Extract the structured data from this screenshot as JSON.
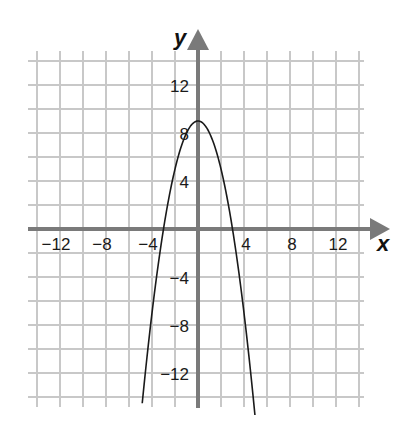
{
  "chart_data": {
    "type": "line",
    "title": "",
    "xlabel": "x",
    "ylabel": "y",
    "xlim": [
      -14,
      14
    ],
    "ylim": [
      -14,
      14
    ],
    "grid": true,
    "grid_step": 2,
    "x_ticks": [
      -12,
      -8,
      -4,
      4,
      8,
      12
    ],
    "y_ticks": [
      12,
      8,
      4,
      -4,
      -8,
      -12
    ],
    "x_tick_labels": [
      "−12",
      "−8",
      "−4",
      "4",
      "8",
      "12"
    ],
    "y_tick_labels": [
      "12",
      "8",
      "4",
      "−4",
      "−8",
      "−12"
    ],
    "series": [
      {
        "name": "parabola",
        "equation": "y = 9 - x^2",
        "vertex": [
          0,
          9
        ],
        "x_intercepts": [
          -3,
          3
        ],
        "x": [
          -4.85,
          -4,
          -3,
          -2,
          -1,
          0,
          1,
          2,
          3,
          4,
          4.95
        ],
        "values": [
          -14.5,
          -7,
          0,
          5,
          8,
          9,
          8,
          5,
          0,
          -7,
          -15.5
        ]
      }
    ],
    "colors": {
      "grid": "#c8c8c8",
      "axis": "#7a7a7a",
      "curve": "#1a1a1a"
    }
  }
}
